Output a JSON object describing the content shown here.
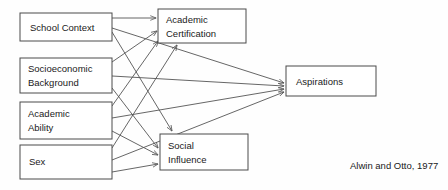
{
  "figure": {
    "type": "path-diagram",
    "citation": "Alwin and Otto, 1977",
    "background_color": "#fefefe",
    "box_stroke_color": "#4a4a4a",
    "edge_stroke_color": "#555555",
    "text_color": "#1a1a1a"
  },
  "nodes": {
    "school_context": {
      "label": "School Context",
      "lines": [
        "School Context"
      ],
      "x": 20,
      "y": 13,
      "w": 92,
      "h": 28,
      "column": "exogenous"
    },
    "socioeconomic_background": {
      "label": "Socioeconomic Background",
      "lines": [
        "Socioeconomic",
        "Background"
      ],
      "line1": "Socioeconomic",
      "line2": "Background",
      "x": 20,
      "y": 58,
      "w": 92,
      "h": 35,
      "column": "exogenous"
    },
    "academic_ability": {
      "label": "Academic Ability",
      "lines": [
        "Academic",
        "Ability"
      ],
      "line1": "Academic",
      "line2": "Ability",
      "x": 20,
      "y": 102,
      "w": 92,
      "h": 37,
      "column": "exogenous"
    },
    "sex": {
      "label": "Sex",
      "lines": [
        "Sex"
      ],
      "x": 20,
      "y": 145,
      "w": 92,
      "h": 34,
      "column": "exogenous"
    },
    "academic_certification": {
      "label": "Academic Certification",
      "lines": [
        "Academic",
        "Certification"
      ],
      "line1": "Academic",
      "line2": "Certification",
      "x": 158,
      "y": 9,
      "w": 88,
      "h": 34,
      "column": "mediator"
    },
    "social_influence": {
      "label": "Social Influence",
      "lines": [
        "Social",
        "Influence"
      ],
      "line1": "Social",
      "line2": "Influence",
      "x": 160,
      "y": 134,
      "w": 88,
      "h": 36,
      "column": "mediator"
    },
    "aspirations": {
      "label": "Aspirations",
      "lines": [
        "Aspirations"
      ],
      "x": 286,
      "y": 66,
      "w": 90,
      "h": 30,
      "column": "outcome"
    }
  },
  "edges": [
    {
      "from": "school_context",
      "to": "academic_certification"
    },
    {
      "from": "school_context",
      "to": "social_influence"
    },
    {
      "from": "school_context",
      "to": "aspirations"
    },
    {
      "from": "socioeconomic_background",
      "to": "academic_certification"
    },
    {
      "from": "socioeconomic_background",
      "to": "social_influence"
    },
    {
      "from": "socioeconomic_background",
      "to": "aspirations"
    },
    {
      "from": "academic_ability",
      "to": "academic_certification"
    },
    {
      "from": "academic_ability",
      "to": "social_influence"
    },
    {
      "from": "academic_ability",
      "to": "aspirations"
    },
    {
      "from": "sex",
      "to": "academic_certification"
    },
    {
      "from": "sex",
      "to": "social_influence"
    },
    {
      "from": "sex",
      "to": "aspirations"
    }
  ]
}
